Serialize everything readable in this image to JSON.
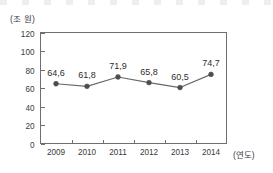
{
  "chart_data": {
    "type": "line",
    "title": "",
    "subtitle": "",
    "xlabel": "(연도)",
    "ylabel": "(조 원)",
    "categories": [
      "2009",
      "2010",
      "2011",
      "2012",
      "2013",
      "2014"
    ],
    "values": [
      64.6,
      61.8,
      71.9,
      65.8,
      60.5,
      74.7
    ],
    "value_labels": [
      "64,6",
      "61,8",
      "71,9",
      "65,8",
      "60,5",
      "74,7"
    ],
    "series": [
      {
        "name": "",
        "values": [
          64.6,
          61.8,
          71.9,
          65.8,
          60.5,
          74.7
        ]
      }
    ],
    "ylim": [
      0,
      120
    ],
    "ytick_labels": [
      "0",
      "20",
      "40",
      "60",
      "80",
      "100",
      "120"
    ],
    "ytick_values": [
      0,
      20,
      40,
      60,
      80,
      100,
      120
    ],
    "xtick_labels": [
      "2009",
      "2010",
      "2011",
      "2012",
      "2013",
      "2014"
    ],
    "grid": false,
    "legend": null,
    "legend_position": "none",
    "marker": "circle",
    "colors": {
      "line": "#6a6a6a",
      "marker": "#4d4d4d",
      "axis": "#6f6f6f",
      "text": "#3a3a3a",
      "background": "#ffffff"
    }
  },
  "axes": {
    "y_unit": "(조 원)",
    "x_unit": "(연도)"
  }
}
